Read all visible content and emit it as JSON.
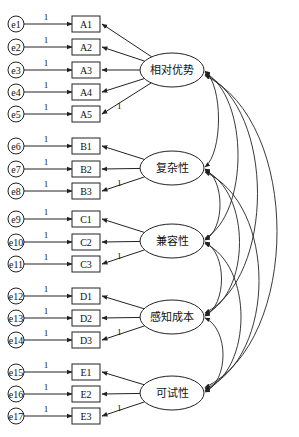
{
  "diagram": {
    "type": "structural-equation-model",
    "latents": [
      {
        "id": "RA",
        "label": "相对优势",
        "cy": 70,
        "indicators": [
          "A1",
          "A2",
          "A3",
          "A4",
          "A5"
        ]
      },
      {
        "id": "CX",
        "label": "复杂性",
        "cy": 168,
        "indicators": [
          "B1",
          "B2",
          "B3"
        ]
      },
      {
        "id": "CP",
        "label": "兼容性",
        "cy": 241,
        "indicators": [
          "C1",
          "C2",
          "C3"
        ]
      },
      {
        "id": "PC",
        "label": "感知成本",
        "cy": 317,
        "indicators": [
          "D1",
          "D2",
          "D3"
        ]
      },
      {
        "id": "TR",
        "label": "可试性",
        "cy": 393,
        "indicators": [
          "E1",
          "E2",
          "E3"
        ]
      }
    ],
    "indicators": [
      {
        "label": "A1",
        "error": "e1",
        "y": 24
      },
      {
        "label": "A2",
        "error": "e2",
        "y": 47
      },
      {
        "label": "A3",
        "error": "e3",
        "y": 70
      },
      {
        "label": "A4",
        "error": "e4",
        "y": 92
      },
      {
        "label": "A5",
        "error": "e5",
        "y": 114
      },
      {
        "label": "B1",
        "error": "e6",
        "y": 146
      },
      {
        "label": "B2",
        "error": "e7",
        "y": 169
      },
      {
        "label": "B3",
        "error": "e8",
        "y": 191
      },
      {
        "label": "C1",
        "error": "e9",
        "y": 219
      },
      {
        "label": "C2",
        "error": "e10",
        "y": 242
      },
      {
        "label": "C3",
        "error": "e11",
        "y": 264
      },
      {
        "label": "D1",
        "error": "e12",
        "y": 296
      },
      {
        "label": "D2",
        "error": "e13",
        "y": 318
      },
      {
        "label": "D3",
        "error": "e14",
        "y": 340
      },
      {
        "label": "E1",
        "error": "e15",
        "y": 372
      },
      {
        "label": "E2",
        "error": "e16",
        "y": 394
      },
      {
        "label": "E3",
        "error": "e17",
        "y": 416
      }
    ],
    "fixed_loading_label": "1",
    "error_path_label": "1",
    "covariances": "all latent pairs correlated (double-headed arcs on right)"
  }
}
